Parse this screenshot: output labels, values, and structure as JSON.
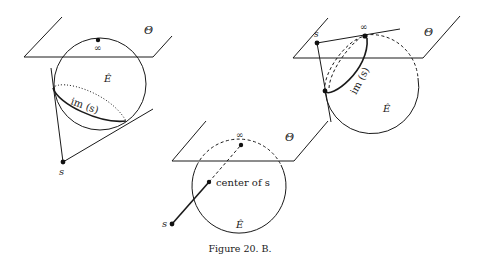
{
  "figure": {
    "caption": "Figure 20. B.",
    "panels": [
      {
        "id": "left",
        "plane_label": "Θ",
        "sphere_label": "Ê",
        "infinity_label": "∞",
        "image_label": "im (s)",
        "point_label": "s"
      },
      {
        "id": "right",
        "plane_label": "Θ",
        "sphere_label": "Ê",
        "infinity_label": "∞",
        "image_label": "im (s)",
        "point_label": "s"
      },
      {
        "id": "bottom",
        "plane_label": "Θ",
        "sphere_label": "Ê",
        "infinity_label": "∞",
        "center_label": "center of s",
        "point_label": "s"
      }
    ]
  }
}
